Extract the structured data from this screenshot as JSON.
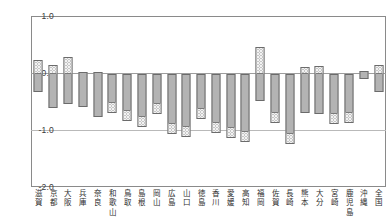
{
  "chart_data": {
    "type": "bar",
    "subtype": "floating-range-bar",
    "title": "",
    "xlabel": "",
    "ylabel": "%",
    "ylim": [
      -2.0,
      1.0
    ],
    "yticks": [
      1.0,
      0.0,
      -1.0,
      -2.0
    ],
    "ytick_labels": [
      "1.0",
      "%0.0",
      "-1.0",
      "-2.0"
    ],
    "grid": true,
    "legend": "none",
    "categories": [
      "滋賀",
      "京都",
      "大阪",
      "兵庫",
      "奈良",
      "和歌山",
      "鳥取",
      "島根",
      "岡山",
      "広島",
      "山口",
      "徳島",
      "香川",
      "愛媛",
      "高知",
      "福岡",
      "佐賀",
      "長崎",
      "熊本",
      "大分",
      "宮崎",
      "鹿児島",
      "沖縄",
      "全国"
    ],
    "series": [
      {
        "name": "上限",
        "values": [
          0.22,
          0.14,
          0.28,
          0.02,
          0.02,
          -0.02,
          -0.02,
          -0.02,
          -0.02,
          -0.02,
          -0.02,
          -0.02,
          -0.02,
          -0.02,
          -0.02,
          0.45,
          -0.02,
          -0.02,
          0.1,
          0.12,
          -0.02,
          -0.02,
          0.03,
          0.14
        ]
      },
      {
        "name": "下限",
        "values": [
          -0.33,
          -0.62,
          -0.55,
          -0.6,
          -0.78,
          -0.7,
          -0.84,
          -0.95,
          -0.72,
          -1.07,
          -1.12,
          -0.8,
          -1.06,
          -1.14,
          -1.21,
          -0.5,
          -0.88,
          -1.25,
          -0.7,
          -0.72,
          -0.9,
          -0.88,
          -0.1,
          -0.33
        ]
      }
    ],
    "cap_end": [
      "top",
      "top",
      "top",
      "none",
      "none",
      "bottom",
      "bottom",
      "bottom",
      "bottom",
      "bottom",
      "bottom",
      "bottom",
      "bottom",
      "bottom",
      "bottom",
      "top",
      "bottom",
      "bottom",
      "top",
      "top",
      "bottom",
      "bottom",
      "none",
      "top"
    ]
  }
}
